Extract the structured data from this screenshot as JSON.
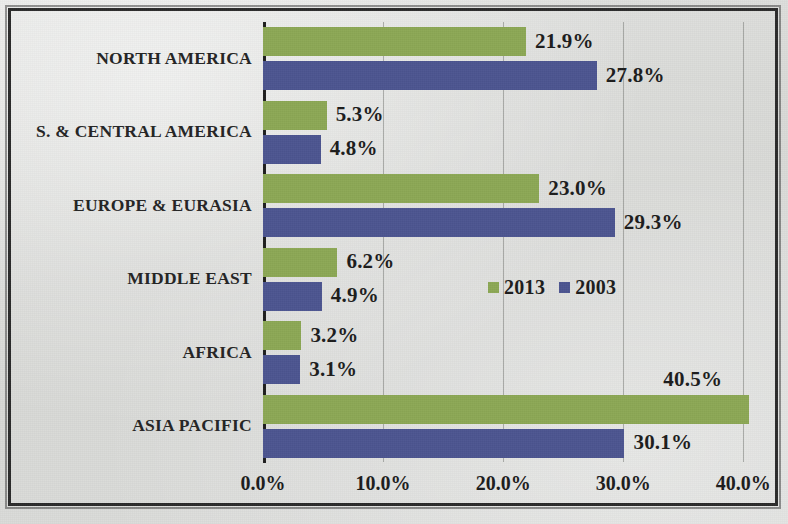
{
  "chart_data": {
    "type": "bar",
    "orientation": "horizontal",
    "title": "",
    "subtitle": "",
    "xlabel": "",
    "ylabel": "",
    "xlim": [
      0,
      43.3
    ],
    "grid": true,
    "legend_position": "middle-right-inside",
    "categories": [
      "NORTH AMERICA",
      "S. & CENTRAL AMERICA",
      "EUROPE & EURASIA",
      "MIDDLE EAST",
      "AFRICA",
      "ASIA PACIFIC"
    ],
    "series": [
      {
        "name": "2013",
        "color": "#8ca855",
        "values": [
          21.9,
          5.3,
          23.0,
          6.2,
          3.2,
          40.5
        ],
        "labels": [
          "21.9%",
          "5.3%",
          "23.0%",
          "6.2%",
          "3.2%",
          "40.5%"
        ]
      },
      {
        "name": "2003",
        "color": "#4c5590",
        "values": [
          27.8,
          4.8,
          29.3,
          4.9,
          3.1,
          30.1
        ],
        "labels": [
          "27.8%",
          "4.8%",
          "29.3%",
          "4.9%",
          "3.1%",
          "30.1%"
        ]
      }
    ],
    "x_ticks": [
      0,
      10,
      20,
      30,
      40
    ],
    "x_tick_labels": [
      "0.0%",
      "10.0%",
      "20.0%",
      "30.0%",
      "40.0%"
    ],
    "colors": {
      "series_2013": "#8ca855",
      "series_2003": "#4c5590",
      "axis": "#1e1e1e",
      "gridline": "#787a76",
      "text": "#1c1c1c",
      "background": "#dcdddb"
    }
  },
  "legend": {
    "entries": [
      {
        "label": "2013",
        "color": "#8ca855"
      },
      {
        "label": "2003",
        "color": "#4c5590"
      }
    ]
  }
}
